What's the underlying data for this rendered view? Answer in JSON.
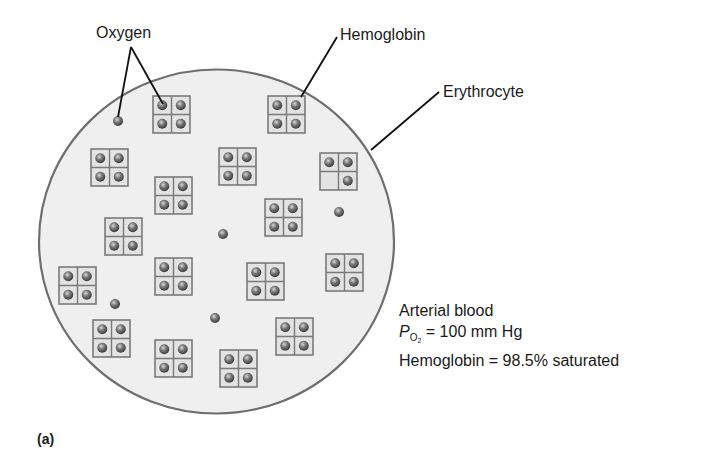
{
  "labels": {
    "oxygen": "Oxygen",
    "hemoglobin": "Hemoglobin",
    "erythrocyte": "Erythrocyte"
  },
  "info": {
    "line1": "Arterial blood",
    "po2_symbol": "P",
    "po2_subscript": "O",
    "po2_subscript_2": "2",
    "po2_value": " = 100 mm Hg",
    "line3": "Hemoglobin = 98.5% saturated"
  },
  "panel_label": "(a)",
  "colors": {
    "cell_fill": "#efefef",
    "cell_outline": "#6e6e6e",
    "box_fill": "#e3e3e3",
    "box_stroke": "#7a7a7a",
    "oxygen_dot": "#6a6a6a",
    "leader_line": "#111111"
  },
  "cell": {
    "cx": 216.5,
    "cy": 241.5,
    "rx": 177.5,
    "ry": 172
  },
  "hemoglobin_molecules": [
    {
      "x": 153,
      "y": 96,
      "bound": [
        1,
        1,
        1,
        1
      ]
    },
    {
      "x": 268,
      "y": 96,
      "bound": [
        1,
        1,
        1,
        1
      ]
    },
    {
      "x": 91,
      "y": 149,
      "bound": [
        1,
        1,
        1,
        1
      ]
    },
    {
      "x": 219,
      "y": 148,
      "bound": [
        1,
        1,
        1,
        1
      ]
    },
    {
      "x": 320,
      "y": 153,
      "bound": [
        1,
        1,
        0,
        1
      ]
    },
    {
      "x": 155,
      "y": 177,
      "bound": [
        1,
        1,
        1,
        1
      ]
    },
    {
      "x": 265,
      "y": 199,
      "bound": [
        1,
        1,
        1,
        1
      ]
    },
    {
      "x": 105,
      "y": 218,
      "bound": [
        1,
        1,
        1,
        1
      ]
    },
    {
      "x": 59,
      "y": 267,
      "bound": [
        1,
        1,
        1,
        1
      ]
    },
    {
      "x": 155,
      "y": 258,
      "bound": [
        1,
        1,
        1,
        1
      ]
    },
    {
      "x": 247,
      "y": 263,
      "bound": [
        1,
        1,
        1,
        1
      ]
    },
    {
      "x": 326,
      "y": 254,
      "bound": [
        1,
        1,
        1,
        1
      ]
    },
    {
      "x": 93,
      "y": 320,
      "bound": [
        1,
        1,
        1,
        1
      ]
    },
    {
      "x": 276,
      "y": 318,
      "bound": [
        1,
        1,
        1,
        1
      ]
    },
    {
      "x": 155,
      "y": 340,
      "bound": [
        1,
        1,
        1,
        1
      ]
    },
    {
      "x": 220,
      "y": 350,
      "bound": [
        1,
        1,
        1,
        1
      ]
    }
  ],
  "free_oxygen": [
    {
      "x": 118,
      "y": 121
    },
    {
      "x": 339,
      "y": 212
    },
    {
      "x": 223,
      "y": 234
    },
    {
      "x": 115,
      "y": 304
    },
    {
      "x": 215,
      "y": 318
    }
  ],
  "leaders": [
    {
      "name": "oxygen-leader-free",
      "x1": 131,
      "y1": 47,
      "x2": 118,
      "y2": 117
    },
    {
      "name": "oxygen-leader-bound",
      "x1": 131,
      "y1": 47,
      "x2": 163,
      "y2": 104
    },
    {
      "name": "hemoglobin-leader",
      "x1": 337,
      "y1": 37,
      "x2": 301,
      "y2": 97
    },
    {
      "name": "erythrocyte-leader",
      "x1": 439,
      "y1": 92,
      "x2": 371,
      "y2": 150
    }
  ]
}
